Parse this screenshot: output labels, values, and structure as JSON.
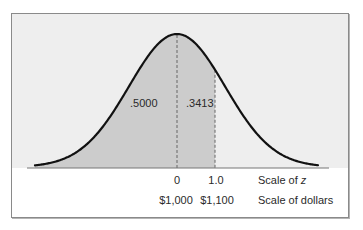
{
  "chart_data": {
    "type": "area",
    "title": "",
    "distribution": "normal",
    "mean_dollars": 1000,
    "sd_dollars": 100,
    "shaded_region": {
      "from_z": "-inf",
      "to_z": 1.0
    },
    "area_labels": [
      {
        "region": "left of mean (z < 0)",
        "value": ".5000"
      },
      {
        "region": "between z = 0 and z = 1.0",
        "value": ".3413"
      }
    ],
    "x_axes": [
      {
        "name": "Scale of z",
        "ticks": [
          "0",
          "1.0"
        ],
        "values": [
          0,
          1.0
        ]
      },
      {
        "name": "Scale of dollars",
        "ticks": [
          "$1,000",
          "$1,100"
        ],
        "values": [
          1000,
          1100
        ]
      }
    ],
    "reference_lines": [
      {
        "style": "dashed",
        "at_z": 0
      },
      {
        "style": "dashed",
        "at_z": 1.0
      }
    ],
    "grid": false,
    "legend": null
  },
  "labels": {
    "area_left": ".5000",
    "area_mid": ".3413",
    "z_tick_0": "0",
    "z_tick_1": "1.0",
    "z_scale_prefix": "Scale of ",
    "z_scale_var": "z",
    "dollar_tick_0": "$1,000",
    "dollar_tick_1": "$1,100",
    "dollar_scale": "Scale of dollars"
  },
  "colors": {
    "panel_fill": "#eeeeee",
    "shade_fill": "#cccccc",
    "curve": "#111111",
    "axis": "#777777"
  }
}
